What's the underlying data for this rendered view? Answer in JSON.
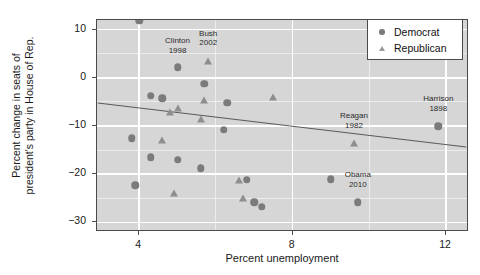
{
  "chart_data": {
    "type": "scatter",
    "title": "",
    "xlabel": "Percent unemployment",
    "ylabel": "Percent change in seats of\npresident's party in House of Rep.",
    "xlim": [
      2.9,
      12.6
    ],
    "ylim": [
      -32,
      12
    ],
    "xticks": [
      4,
      8,
      12
    ],
    "yticks": [
      10,
      0,
      -10,
      -20,
      -30
    ],
    "grid": true,
    "legend_position": "top-right",
    "legend": [
      {
        "name": "Democrat",
        "marker": "circle",
        "color": "#7b7b7b"
      },
      {
        "name": "Republican",
        "marker": "triangle",
        "color": "#8e8e8e"
      }
    ],
    "series": [
      {
        "name": "Democrat",
        "marker": "circle",
        "color": "#7b7b7b",
        "points": [
          {
            "x": 4.0,
            "y": 11.8
          },
          {
            "x": 5.0,
            "y": 2.2
          },
          {
            "x": 5.7,
            "y": -1.2
          },
          {
            "x": 4.3,
            "y": -3.7
          },
          {
            "x": 4.6,
            "y": -4.2
          },
          {
            "x": 6.3,
            "y": -5.2
          },
          {
            "x": 3.8,
            "y": -12.5
          },
          {
            "x": 6.2,
            "y": -10.8
          },
          {
            "x": 4.3,
            "y": -16.5
          },
          {
            "x": 5.0,
            "y": -17.0
          },
          {
            "x": 3.9,
            "y": -22.3
          },
          {
            "x": 6.8,
            "y": -21.2
          },
          {
            "x": 9.0,
            "y": -21.0
          },
          {
            "x": 7.2,
            "y": -26.8
          },
          {
            "x": 7.0,
            "y": -25.8
          },
          {
            "x": 9.7,
            "y": -25.8
          },
          {
            "x": 11.8,
            "y": -10.0
          },
          {
            "x": 5.6,
            "y": -18.8
          }
        ]
      },
      {
        "name": "Republican",
        "marker": "triangle",
        "color": "#8e8e8e",
        "points": [
          {
            "x": 5.8,
            "y": 3.4
          },
          {
            "x": 7.5,
            "y": -4.0
          },
          {
            "x": 5.7,
            "y": -4.5
          },
          {
            "x": 5.0,
            "y": -6.3
          },
          {
            "x": 4.8,
            "y": -7.0
          },
          {
            "x": 5.6,
            "y": -8.5
          },
          {
            "x": 4.6,
            "y": -13.0
          },
          {
            "x": 9.6,
            "y": -13.5
          },
          {
            "x": 4.9,
            "y": -24.0
          },
          {
            "x": 6.7,
            "y": -25.0
          },
          {
            "x": 6.6,
            "y": -21.3
          }
        ]
      }
    ],
    "fit_line": {
      "x_start": 2.9,
      "y_start": -5.4,
      "x_end": 12.6,
      "y_end": -14.6,
      "color": "#5a5a5a"
    },
    "annotations": [
      {
        "label": "Clinton\n1998",
        "x": 5.0,
        "y": 6.6,
        "point_x": 5.0,
        "point_y": 2.2
      },
      {
        "label": "Bush\n2002",
        "x": 5.8,
        "y": 8.1,
        "point_x": 5.8,
        "point_y": 3.4
      },
      {
        "label": "Reagan\n1982",
        "x": 9.6,
        "y": -9.0,
        "point_x": 9.6,
        "point_y": -13.5
      },
      {
        "label": "Obama\n2010",
        "x": 9.7,
        "y": -21.3,
        "point_x": 9.7,
        "point_y": -25.8
      },
      {
        "label": "Harrison\n1898",
        "x": 11.8,
        "y": -5.5,
        "point_x": 11.8,
        "point_y": -10.0
      }
    ]
  },
  "axes": {
    "x_title": "Percent unemployment",
    "y_title": "Percent change in seats of\npresident's party in House of Rep.",
    "x_tick_labels": [
      "4",
      "8",
      "12"
    ],
    "y_tick_labels": [
      "10",
      "0",
      "-10",
      "-20",
      "-30"
    ]
  },
  "legend": {
    "democrat_label": "Democrat",
    "republican_label": "Republican"
  }
}
